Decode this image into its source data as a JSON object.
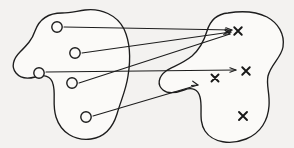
{
  "figure": {
    "type": "set-mapping-diagram",
    "caption": "",
    "background_color": "#f3f2f0",
    "ink_color": "#1d1d1d",
    "width": 294,
    "height": 148
  },
  "domain_set": {
    "name": "domain-blob",
    "label": "",
    "shape": "amoeba",
    "element_symbol": "o",
    "element_count": 5,
    "elements": [
      {
        "id": "d1",
        "label": "",
        "x": 57,
        "y": 27,
        "r": 5.2
      },
      {
        "id": "d2",
        "label": "",
        "x": 75,
        "y": 53,
        "r": 5.2
      },
      {
        "id": "d3",
        "label": "",
        "x": 39,
        "y": 73,
        "r": 5.2
      },
      {
        "id": "d4",
        "label": "",
        "x": 72,
        "y": 83,
        "r": 5.2
      },
      {
        "id": "d5",
        "label": "",
        "x": 86,
        "y": 117,
        "r": 5.2
      }
    ],
    "outline_path": "M 62 13 C 48 13 39 20 35 31 C 32 40 27 45 20 52 C 13 59 11 67 16 73 C 21 79 28 79 35 77 C 44 74 51 76 53 84 C 56 94 52 104 56 117 C 61 133 75 141 91 139 C 105 137 113 127 117 114 C 121 100 126 90 128 76 C 131 58 130 42 124 29 C 117 15 101 8 85 10 C 77 11 70 13 62 13 Z"
  },
  "codomain_set": {
    "name": "codomain-blob",
    "label": "",
    "shape": "irregular-notched",
    "element_symbol": "x",
    "element_count": 4,
    "elements": [
      {
        "id": "c1",
        "label": "x",
        "x": 238,
        "y": 31,
        "size": 7.5
      },
      {
        "id": "c2",
        "label": "x",
        "x": 215,
        "y": 78,
        "size": 7.0
      },
      {
        "id": "c3",
        "label": "x",
        "x": 246,
        "y": 71,
        "size": 7.5
      },
      {
        "id": "c4",
        "label": "x",
        "x": 243,
        "y": 116,
        "size": 8.0
      }
    ],
    "outline_path": "M 228 13 C 217 14 210 21 207 31 C 204 41 200 49 192 56 C 182 64 172 67 166 71 C 158 77 157 85 163 90 C 168 94 176 93 184 90 C 192 87 198 89 200 97 C 203 108 198 120 205 131 C 213 143 231 145 246 139 C 261 133 268 120 269 106 C 270 93 266 85 268 76 C 271 64 281 58 283 47 C 285 34 278 23 267 17 C 255 11 240 11 228 13 Z"
  },
  "arrows": [
    {
      "id": "a1",
      "name": "arrow-d1-to-c1",
      "from": "d1",
      "to": "c1",
      "from_x": 64,
      "from_y": 27,
      "to_x": 232,
      "to_y": 30,
      "head_angle": 181
    },
    {
      "id": "a2",
      "name": "arrow-d2-to-c1",
      "from": "d2",
      "to": "c1",
      "from_x": 82,
      "from_y": 53,
      "to_x": 231,
      "to_y": 32,
      "head_angle": 188
    },
    {
      "id": "a3",
      "name": "arrow-d4-to-c1",
      "from": "d4",
      "to": "c1",
      "from_x": 79,
      "from_y": 83,
      "to_x": 230,
      "to_y": 34,
      "head_angle": 198
    },
    {
      "id": "a4",
      "name": "arrow-d3-to-c3",
      "from": "d3",
      "to": "c3",
      "from_x": 46,
      "from_y": 72,
      "to_x": 236,
      "to_y": 70,
      "head_angle": 180
    },
    {
      "id": "a5",
      "name": "arrow-d5-to-c2",
      "from": "d5",
      "to": "c2",
      "from_x": 93,
      "from_y": 116,
      "to_x": 198,
      "to_y": 85,
      "head_angle": 196
    }
  ]
}
